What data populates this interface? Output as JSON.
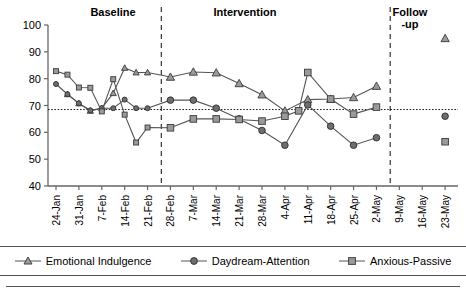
{
  "phases": {
    "baseline": "Baseline",
    "intervention": "Intervention",
    "followup": "Follow\n-up"
  },
  "legend": {
    "items": [
      {
        "label": "Emotional Indulgence",
        "marker": "triangle-marker",
        "color": "#555555"
      },
      {
        "label": "Daydream-Attention",
        "marker": "circle-marker",
        "color": "#555555"
      },
      {
        "label": "Anxious-Passive",
        "marker": "square-marker",
        "color": "#555555"
      }
    ]
  },
  "chart_data": {
    "type": "line",
    "title": "",
    "xlabel": "",
    "ylabel": "",
    "ylim": [
      40,
      100
    ],
    "yticks": [
      40,
      50,
      60,
      70,
      80,
      90,
      100
    ],
    "grid": false,
    "reference_line": {
      "value": 68.5,
      "style": "dotted"
    },
    "phase_dividers": [
      4.6,
      14.6
    ],
    "legend_position": "bottom",
    "categories": [
      "24-Jan",
      "31-Jan",
      "7-Feb",
      "14-Feb",
      "21-Feb",
      "28-Feb",
      "7-Mar",
      "14-Mar",
      "21-Mar",
      "28-Mar",
      "4-Apr",
      "11-Apr",
      "18-Apr",
      "25-Apr",
      "2-May",
      "9-May",
      "16-May",
      "23-May"
    ],
    "series": [
      {
        "name": "Emotional Indulgence",
        "marker": "triangle",
        "points": [
          {
            "x": 0.5,
            "y": 74.2
          },
          {
            "x": 1.0,
            "y": 70.8
          },
          {
            "x": 1.5,
            "y": 68.0
          },
          {
            "x": 2.0,
            "y": 69.0
          },
          {
            "x": 2.5,
            "y": 74.6
          },
          {
            "x": 3.0,
            "y": 84.0
          },
          {
            "x": 3.5,
            "y": 82.3
          },
          {
            "x": 4.0,
            "y": 82.3
          },
          {
            "x": 5.0,
            "y": 80.6
          },
          {
            "x": 6.0,
            "y": 82.5
          },
          {
            "x": 7.0,
            "y": 82.2
          },
          {
            "x": 8.0,
            "y": 78.2
          },
          {
            "x": 9.0,
            "y": 74.0
          },
          {
            "x": 10.0,
            "y": 68.0
          },
          {
            "x": 11.0,
            "y": 72.2
          },
          {
            "x": 12.0,
            "y": 72.4
          },
          {
            "x": 13.0,
            "y": 73.0
          },
          {
            "x": 14.0,
            "y": 77.2
          },
          {
            "x": 17.0,
            "y": 95.0
          }
        ]
      },
      {
        "name": "Daydream-Attention",
        "marker": "circle",
        "points": [
          {
            "x": 0.0,
            "y": 78.0
          },
          {
            "x": 0.5,
            "y": 74.2
          },
          {
            "x": 1.0,
            "y": 70.8
          },
          {
            "x": 1.5,
            "y": 68.2
          },
          {
            "x": 2.0,
            "y": 69.0
          },
          {
            "x": 2.5,
            "y": 69.0
          },
          {
            "x": 3.0,
            "y": 72.2
          },
          {
            "x": 3.5,
            "y": 69.0
          },
          {
            "x": 4.0,
            "y": 69.0
          },
          {
            "x": 5.0,
            "y": 72.0
          },
          {
            "x": 6.0,
            "y": 72.0
          },
          {
            "x": 7.0,
            "y": 69.0
          },
          {
            "x": 8.0,
            "y": 65.0
          },
          {
            "x": 9.0,
            "y": 60.7
          },
          {
            "x": 10.0,
            "y": 55.2
          },
          {
            "x": 11.0,
            "y": 70.2
          },
          {
            "x": 12.0,
            "y": 62.3
          },
          {
            "x": 13.0,
            "y": 55.2
          },
          {
            "x": 14.0,
            "y": 58.0
          },
          {
            "x": 17.0,
            "y": 66.0
          }
        ]
      },
      {
        "name": "Anxious-Passive",
        "marker": "square",
        "points": [
          {
            "x": 0.0,
            "y": 82.8
          },
          {
            "x": 0.5,
            "y": 81.5
          },
          {
            "x": 1.0,
            "y": 76.7
          },
          {
            "x": 1.5,
            "y": 76.6
          },
          {
            "x": 2.0,
            "y": 67.8
          },
          {
            "x": 2.5,
            "y": 79.8
          },
          {
            "x": 3.0,
            "y": 66.6
          },
          {
            "x": 3.5,
            "y": 56.2
          },
          {
            "x": 4.0,
            "y": 61.8
          },
          {
            "x": 5.0,
            "y": 61.7
          },
          {
            "x": 6.0,
            "y": 65.0
          },
          {
            "x": 7.0,
            "y": 65.0
          },
          {
            "x": 8.0,
            "y": 64.8
          },
          {
            "x": 9.0,
            "y": 64.2
          },
          {
            "x": 10.0,
            "y": 66.0
          },
          {
            "x": 10.6,
            "y": 68.0
          },
          {
            "x": 11.0,
            "y": 82.3
          },
          {
            "x": 12.0,
            "y": 72.4
          },
          {
            "x": 13.0,
            "y": 66.8
          },
          {
            "x": 14.0,
            "y": 69.4
          },
          {
            "x": 17.0,
            "y": 56.5
          }
        ]
      }
    ]
  }
}
